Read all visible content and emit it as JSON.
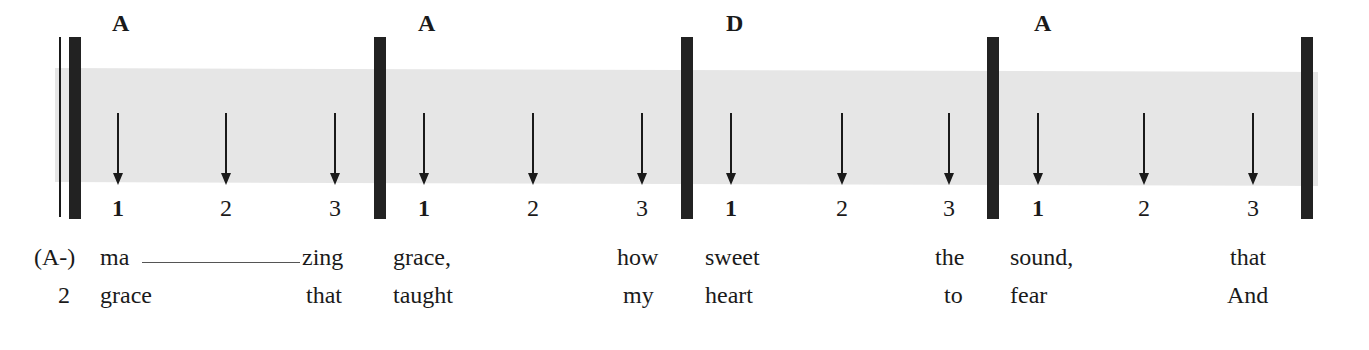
{
  "diagram": {
    "title": "",
    "colors": {
      "band": "#e6e6e6",
      "bar": "#222222",
      "text": "#1a1a1a"
    },
    "measures": [
      {
        "chord": "A",
        "beats": [
          "1",
          "2",
          "3"
        ]
      },
      {
        "chord": "A",
        "beats": [
          "1",
          "2",
          "3"
        ]
      },
      {
        "chord": "D",
        "beats": [
          "1",
          "2",
          "3"
        ]
      },
      {
        "chord": "A",
        "beats": [
          "1",
          "2",
          "3"
        ]
      }
    ],
    "lyrics": {
      "row1": {
        "pickup": "(A-)",
        "words": [
          "ma",
          "zing",
          "grace,",
          "how",
          "sweet",
          "the",
          "sound,",
          "that"
        ]
      },
      "row2": {
        "pickup": "2",
        "words": [
          "grace",
          "that",
          "taught",
          "my",
          "heart",
          "to",
          "fear",
          "And"
        ]
      }
    }
  }
}
